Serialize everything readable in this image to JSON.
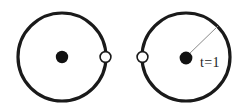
{
  "figure": {
    "background_color": "#ffffff",
    "stroke_color": "#1a1a1a",
    "marker_fill_color": "#ffffff",
    "center_dot_color": "#111111",
    "radius_line_color": "#8a8a8a",
    "width": 252,
    "height": 111
  },
  "panels": [
    {
      "id": "left-panel",
      "name": "circle-panel-start",
      "circle": {
        "cx": 62,
        "cy": 57,
        "r": 44,
        "stroke_width": 3.2
      },
      "center_dot": {
        "cx": 62,
        "cy": 57,
        "r": 6.2
      },
      "marker": {
        "cx": 105.5,
        "cy": 57,
        "r": 5.4,
        "angle_deg": 0
      },
      "radius_line": null,
      "label": null
    },
    {
      "id": "right-panel",
      "name": "circle-panel-end",
      "circle": {
        "cx": 186,
        "cy": 57,
        "r": 44,
        "stroke_width": 3.2
      },
      "center_dot": {
        "cx": 186,
        "cy": 58,
        "r": 6.4
      },
      "marker": {
        "cx": 142.5,
        "cy": 57,
        "r": 5.4,
        "angle_deg": 180
      },
      "radius_line": {
        "x1": 187,
        "y1": 56,
        "x2": 218,
        "y2": 26,
        "stroke_width": 1.0
      },
      "label": {
        "text": "t=1",
        "x": 200,
        "y": 67
      }
    }
  ],
  "annotations": {
    "time_label": "t=1"
  }
}
